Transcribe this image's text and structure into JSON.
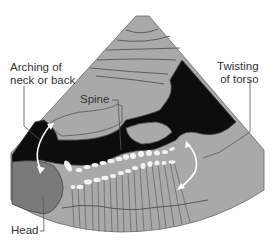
{
  "diagram": {
    "labels": {
      "arching": [
        "Arching of",
        "neck or back"
      ],
      "twisting": [
        "Twisting",
        "of torso"
      ],
      "spine": "Spine",
      "head": "Head"
    },
    "colors": {
      "background": "#ffffff",
      "fan_fill": "#a9a9a9",
      "dark_region": "#0d0d0d",
      "head_fill": "#7a7a7a",
      "outline": "#555555",
      "vertebrae": "#f2f2f2",
      "arrow": "#ffffff",
      "text": "#333333"
    }
  }
}
